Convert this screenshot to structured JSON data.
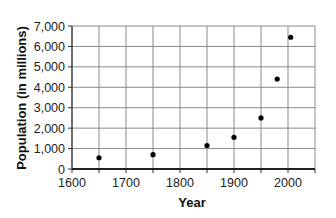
{
  "chart_data": {
    "type": "scatter",
    "title": "",
    "xlabel": "Year",
    "ylabel": "Population (in millions)",
    "xlim": [
      1600,
      2050
    ],
    "ylim": [
      0,
      7000
    ],
    "x_ticks": [
      1600,
      1700,
      1800,
      1900,
      2000
    ],
    "x_tick_labels": [
      "1600",
      "1700",
      "1800",
      "1900",
      "2000"
    ],
    "y_ticks": [
      0,
      1000,
      2000,
      3000,
      4000,
      5000,
      6000,
      7000
    ],
    "y_tick_labels": [
      "0",
      "1,000",
      "2,000",
      "3,000",
      "4,000",
      "5,000",
      "6,000",
      "7,000"
    ],
    "grid": true,
    "legend": "none",
    "series": [
      {
        "name": "World population",
        "x": [
          1650,
          1750,
          1850,
          1900,
          1950,
          1980,
          2005
        ],
        "y": [
          550,
          700,
          1150,
          1550,
          2500,
          4400,
          6450
        ],
        "color": "#000000"
      }
    ]
  }
}
